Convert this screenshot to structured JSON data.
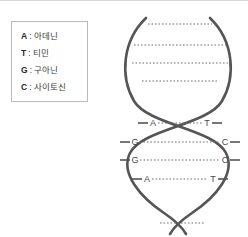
{
  "legend": {
    "separator": ":",
    "entries": [
      {
        "code": "A",
        "name": "아데닌"
      },
      {
        "code": "T",
        "name": "티민"
      },
      {
        "code": "G",
        "name": "구아닌"
      },
      {
        "code": "C",
        "name": "사이토신"
      }
    ]
  },
  "diagram": {
    "strand_color": "#555555",
    "rung_color": "#6e6e6e",
    "label_color": "#4a4a4a",
    "base_pairs": [
      {
        "left": "A",
        "right": "T"
      },
      {
        "left": "G",
        "right": "C"
      },
      {
        "left": "G",
        "right": "C"
      },
      {
        "left": "A",
        "right": "T"
      }
    ],
    "unlabeled_rung_count": 5
  }
}
